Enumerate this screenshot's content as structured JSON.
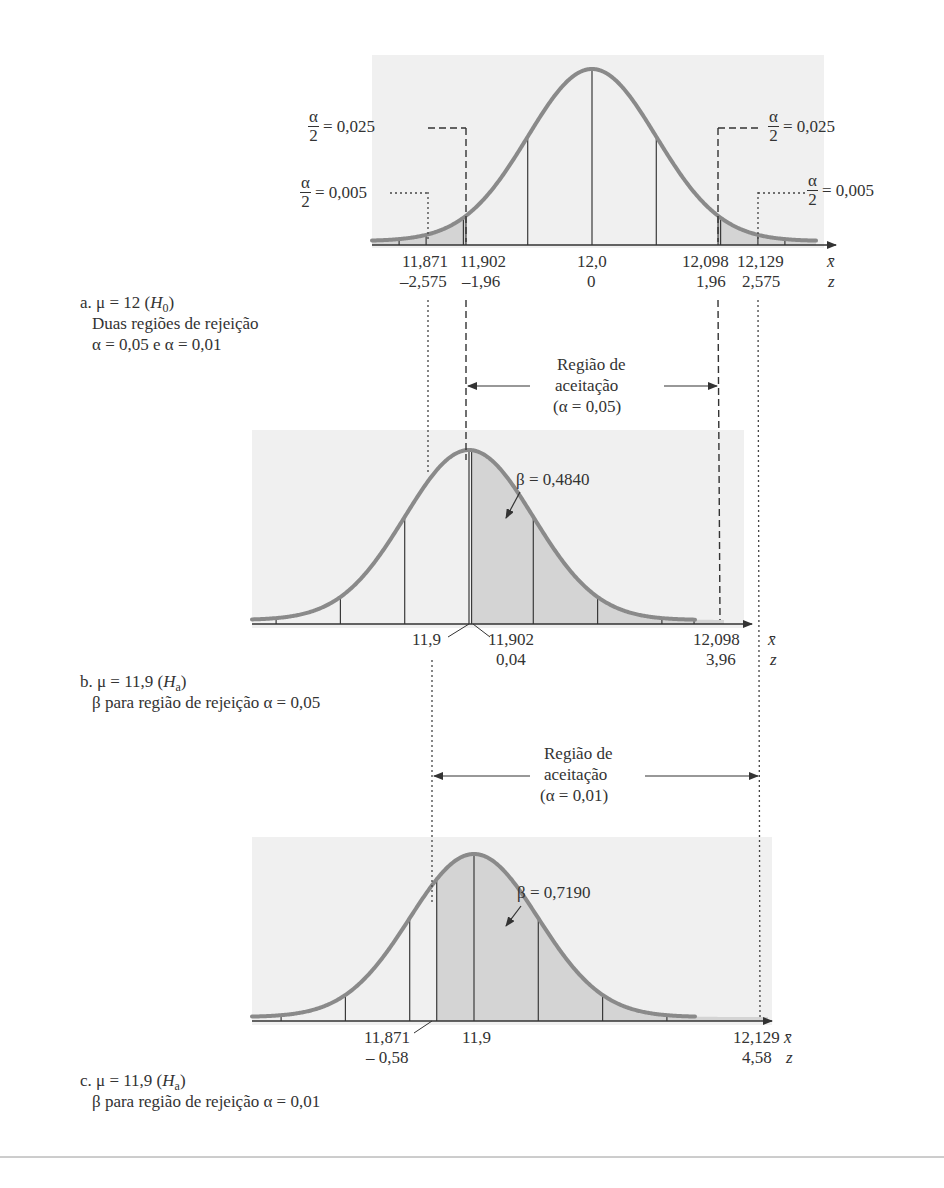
{
  "figure": {
    "panel_a": {
      "caption_line1_prefix": "a. μ = 12 (",
      "caption_H": "H",
      "caption_sub": "0",
      "caption_line1_suffix": ")",
      "caption_line2": "Duas regiões de rejeição",
      "caption_line3": "α = 0,05 e α = 0,01",
      "alpha_num": "α",
      "alpha_den": "2",
      "alpha_half_025": "= 0,025",
      "alpha_half_005": "= 0,005",
      "xbar_ticks": [
        "11,871",
        "11,902",
        "12,0",
        "12,098",
        "12,129"
      ],
      "z_ticks": [
        "–2,575",
        "–1,96",
        "0",
        "1,96",
        "2,575"
      ],
      "xbar_symbol": "x̄",
      "z_symbol": "z"
    },
    "acceptance_1": {
      "line1": "Região de",
      "line2": "aceitação",
      "line3": "(α = 0,05)"
    },
    "panel_b": {
      "caption_line1_prefix": "b. μ = 11,9 (",
      "caption_H": "H",
      "caption_sub": "a",
      "caption_line1_suffix": ")",
      "caption_line2": "β para região de rejeição α = 0,05",
      "beta_label": "β = 0,4840",
      "xbar_ticks": [
        "11,9",
        "11,902",
        "12,098"
      ],
      "z_ticks": [
        "0,04",
        "3,96"
      ],
      "xbar_symbol": "x̄",
      "z_symbol": "z"
    },
    "acceptance_2": {
      "line1": "Região de",
      "line2": "aceitação",
      "line3": "(α = 0,01)"
    },
    "panel_c": {
      "caption_line1_prefix": "c. μ = 11,9 (",
      "caption_H": "H",
      "caption_sub": "a",
      "caption_line1_suffix": ")",
      "caption_line2": "β para região de rejeição α = 0,01",
      "beta_label": "β = 0,7190",
      "xbar_ticks": [
        "11,871",
        "11,9",
        "12,129"
      ],
      "z_ticks": [
        "– 0,58",
        "4,58"
      ],
      "xbar_symbol": "x̄",
      "z_symbol": "z"
    },
    "colors": {
      "curve": "#8a8a8a",
      "shade": "#d4d4d4",
      "panel_bg": "#f1f1f1",
      "lines": "#3a3a3a"
    }
  },
  "chart_data": [
    {
      "type": "area",
      "title": "a. μ = 12 (H0) — Duas regiões de rejeição, α = 0,05 e α = 0,01",
      "distribution": "normal",
      "mean": 12.0,
      "std_error": 0.05,
      "x_label": "x̄",
      "z_label": "z",
      "critical_values_xbar": [
        11.871,
        11.902,
        12.098,
        12.129
      ],
      "critical_values_z": [
        -2.575,
        -1.96,
        1.96,
        2.575
      ],
      "tick_labels_xbar": [
        "11,871",
        "11,902",
        "12,0",
        "12,098",
        "12,129"
      ],
      "tick_labels_z": [
        "–2,575",
        "–1,96",
        "0",
        "1,96",
        "2,575"
      ],
      "annotations": [
        {
          "text": "α/2 = 0,025",
          "at_xbar": 11.902,
          "side": "left"
        },
        {
          "text": "α/2 = 0,005",
          "at_xbar": 11.871,
          "side": "left"
        },
        {
          "text": "α/2 = 0,025",
          "at_xbar": 12.098,
          "side": "right"
        },
        {
          "text": "α/2 = 0,005",
          "at_xbar": 12.129,
          "side": "right"
        }
      ],
      "shaded_regions": [
        {
          "from": "-inf",
          "to": 11.902,
          "label": "rejeição α = 0,05 (esquerda)"
        },
        {
          "from": 12.098,
          "to": "inf",
          "label": "rejeição α = 0,05 (direita)"
        }
      ],
      "acceptance_region_alpha_005": [
        11.902,
        12.098
      ],
      "acceptance_region_alpha_001": [
        11.871,
        12.129
      ]
    },
    {
      "type": "area",
      "title": "b. μ = 11,9 (Ha) — β para região de rejeição α = 0,05",
      "distribution": "normal",
      "mean": 11.9,
      "std_error": 0.05,
      "x_label": "x̄",
      "z_label": "z",
      "beta": 0.484,
      "beta_label": "β = 0,4840",
      "shaded_region": {
        "from": 11.902,
        "to": 12.098
      },
      "tick_labels_xbar": [
        "11,9",
        "11,902",
        "12,098"
      ],
      "tick_labels_z": [
        "0,04",
        "3,96"
      ],
      "z_values": [
        0.04,
        3.96
      ]
    },
    {
      "type": "area",
      "title": "c. μ = 11,9 (Ha) — β para região de rejeição α = 0,01",
      "distribution": "normal",
      "mean": 11.9,
      "std_error": 0.05,
      "x_label": "x̄",
      "z_label": "z",
      "beta": 0.719,
      "beta_label": "β = 0,7190",
      "shaded_region": {
        "from": 11.871,
        "to": 12.129
      },
      "tick_labels_xbar": [
        "11,871",
        "11,9",
        "12,129"
      ],
      "tick_labels_z": [
        "– 0,58",
        "4,58"
      ],
      "z_values": [
        -0.58,
        4.58
      ]
    }
  ]
}
